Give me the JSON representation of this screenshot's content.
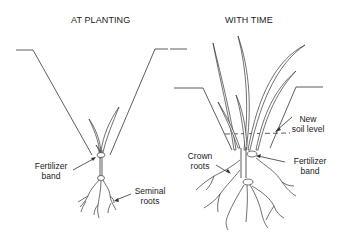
{
  "panels": [
    {
      "title": "AT PLANTING",
      "labels": {
        "fertilizer_band": [
          "Fertilizer",
          "band"
        ],
        "seminal_roots": [
          "Seminal",
          "roots"
        ]
      }
    },
    {
      "title": "WITH TIME",
      "labels": {
        "new_soil_level": [
          "New",
          "soil level"
        ],
        "crown_roots": [
          "Crown",
          "roots"
        ],
        "fertilizer_band": [
          "Fertilizer",
          "band"
        ]
      }
    }
  ],
  "colors": {
    "line": "#333333",
    "background": "#ffffff",
    "text": "#222222"
  }
}
